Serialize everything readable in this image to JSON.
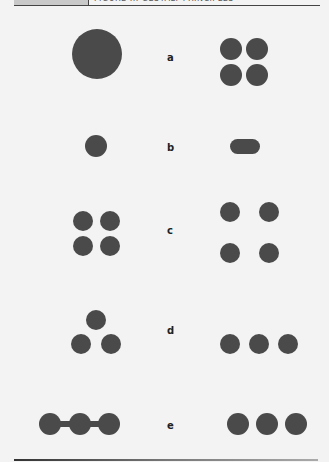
{
  "header": {
    "tab_text": "",
    "caption_text": "FIGURE ... GESTALT PRINCIPLES"
  },
  "colors": {
    "shape_fill": "#4a4a4a",
    "background": "#f3f3f3",
    "rule": "#444444"
  },
  "rows": [
    {
      "label": "a",
      "left": "one large circle",
      "right": "four small circles in 2x2 tight grid"
    },
    {
      "label": "b",
      "left": "one small circle",
      "right": "horizontal pill / elongated shape"
    },
    {
      "label": "c",
      "left": "four circles in tight 2x2 grid",
      "right": "four circles in widely spaced 2x2 grid"
    },
    {
      "label": "d",
      "left": "three circles in triangle",
      "right": "three circles in a row"
    },
    {
      "label": "e",
      "left": "three circles connected by bars",
      "right": "three separate circles in a row"
    }
  ]
}
